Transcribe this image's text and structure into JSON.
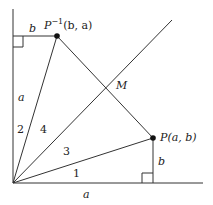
{
  "diagram": {
    "points": {
      "origin": {
        "x": 13,
        "y": 183
      },
      "P": {
        "x": 153,
        "y": 138,
        "label": "P(a, b)"
      },
      "P_inverse": {
        "x": 57,
        "y": 36,
        "label_main": "P",
        "label_sup": "−1",
        "label_coords": "(b, a)"
      },
      "M": {
        "x": 107,
        "y": 87,
        "label": "M"
      }
    },
    "side_labels": {
      "top_b": "b",
      "left_a": "a",
      "right_b": "b",
      "bottom_a": "a"
    },
    "region_labels": {
      "r1": "1",
      "r2": "2",
      "r3": "3",
      "r4": "4"
    }
  }
}
